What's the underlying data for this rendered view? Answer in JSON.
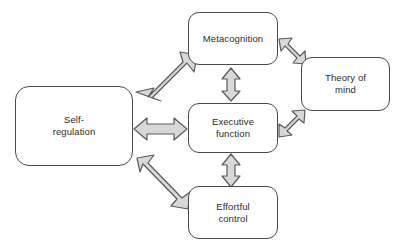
{
  "diagram": {
    "background_color": "#ffffff",
    "box_border_color": "#4a4a4a",
    "box_fill_color": "#ffffff",
    "arrow_fill_color": "#d8d8d8",
    "arrow_stroke_color": "#5a5a5a",
    "text_color": "#2b2b2b",
    "nodes": [
      {
        "id": "metacognition",
        "label": "Metacognition",
        "x": 188,
        "y": 12,
        "width": 90,
        "height": 53
      },
      {
        "id": "theory-of-mind",
        "label": "Theory of\nmind",
        "x": 301,
        "y": 57,
        "width": 89,
        "height": 54
      },
      {
        "id": "self-regulation",
        "label": "Self-\nregulation",
        "x": 15,
        "y": 86,
        "width": 118,
        "height": 80
      },
      {
        "id": "executive-function",
        "label": "Executive\nfunction",
        "x": 188,
        "y": 103,
        "width": 90,
        "height": 50
      },
      {
        "id": "effortful-control",
        "label": "Effortful\ncontrol",
        "x": 188,
        "y": 186,
        "width": 90,
        "height": 53
      }
    ],
    "connectors": [
      {
        "id": "self-regulation-metacognition",
        "from": "self-regulation",
        "to": "metacognition",
        "style": "double-headed-arrow",
        "orientation": "diagonal-up-right"
      },
      {
        "id": "self-regulation-executive-function",
        "from": "self-regulation",
        "to": "executive-function",
        "style": "double-headed-arrow",
        "orientation": "horizontal"
      },
      {
        "id": "self-regulation-effortful-control",
        "from": "self-regulation",
        "to": "effortful-control",
        "style": "double-headed-arrow",
        "orientation": "diagonal-down-right"
      },
      {
        "id": "metacognition-executive-function",
        "from": "metacognition",
        "to": "executive-function",
        "style": "double-headed-arrow",
        "orientation": "vertical"
      },
      {
        "id": "metacognition-theory-of-mind",
        "from": "metacognition",
        "to": "theory-of-mind",
        "style": "double-headed-arrow",
        "orientation": "diagonal-down-right"
      },
      {
        "id": "executive-function-theory-of-mind",
        "from": "executive-function",
        "to": "theory-of-mind",
        "style": "double-headed-arrow",
        "orientation": "diagonal-up-right"
      },
      {
        "id": "executive-function-effortful-control",
        "from": "executive-function",
        "to": "effortful-control",
        "style": "double-headed-arrow",
        "orientation": "vertical"
      }
    ]
  }
}
